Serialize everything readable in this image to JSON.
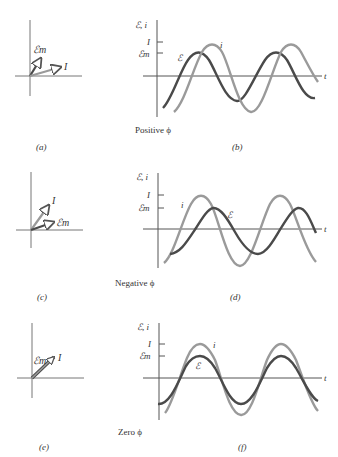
{
  "figure": {
    "colors": {
      "emf_curve": "#4a4a4a",
      "current_curve": "#9a9a9a",
      "axes": "#555555",
      "text": "#333333"
    },
    "rows": [
      {
        "phasor_caption": "(a)",
        "graph_caption": "(b)",
        "phase_label": "Positive ϕ",
        "phasor": {
          "emf_label": "ℰm",
          "current_label": "I"
        },
        "graph": {
          "y_axis_label": "ℰ, i",
          "x_axis_label": "t",
          "tick_I": "I",
          "tick_Em": "ℰm",
          "curve_label_emf": "ℰ",
          "curve_label_current": "i"
        }
      },
      {
        "phasor_caption": "(c)",
        "graph_caption": "(d)",
        "phase_label": "Negative ϕ",
        "phasor": {
          "emf_label": "ℰm",
          "current_label": "I"
        },
        "graph": {
          "y_axis_label": "ℰ, i",
          "x_axis_label": "t",
          "tick_I": "I",
          "tick_Em": "ℰm",
          "curve_label_emf": "ℰ",
          "curve_label_current": "i"
        }
      },
      {
        "phasor_caption": "(e)",
        "graph_caption": "(f)",
        "phase_label": "Zero ϕ",
        "phasor": {
          "emf_label": "ℰm",
          "current_label": "I"
        },
        "graph": {
          "y_axis_label": "ℰ, i",
          "x_axis_label": "t",
          "tick_I": "I",
          "tick_Em": "ℰm",
          "curve_label_emf": "ℰ",
          "curve_label_current": "i"
        }
      }
    ]
  }
}
